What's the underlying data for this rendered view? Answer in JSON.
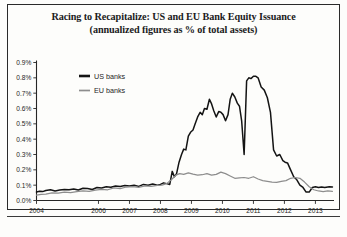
{
  "figure": {
    "title_line_1": "Racing to Recapitalize: US and EU Bank Equity Issuance",
    "title_line_2": "(annualized figures as % of total assets)"
  },
  "legend": {
    "position": "top-left-inside",
    "entries": [
      {
        "label": "US banks",
        "color": "#141414"
      },
      {
        "label": "EU banks",
        "color": "#8d8d8d"
      }
    ]
  },
  "chart_data": {
    "type": "line",
    "title": "Racing to Recapitalize: US and EU Bank Equity Issuance (annualized figures as % of total assets)",
    "xlabel": "",
    "ylabel": "",
    "grid": false,
    "legend_position": "top-left-inside",
    "xlim": [
      2004.0,
      2013.6
    ],
    "ylim": [
      0.0,
      0.9
    ],
    "ytick_labels": [
      "0.0%",
      "0.1%",
      "0.2%",
      "0.3%",
      "0.4%",
      "0.5%",
      "0.6%",
      "0.7%",
      "0.8%",
      "0.9%"
    ],
    "ytick_values": [
      0.0,
      0.1,
      0.2,
      0.3,
      0.4,
      0.5,
      0.6,
      0.7,
      0.8,
      0.9
    ],
    "xtick_labels": [
      "2004",
      "2006",
      "2007",
      "2008",
      "2009",
      "2010",
      "2011",
      "2012",
      "2013"
    ],
    "xtick_values": [
      2004,
      2006,
      2007,
      2008,
      2009,
      2010,
      2011,
      2012,
      2013
    ],
    "series": [
      {
        "name": "US banks",
        "color": "#141414",
        "x": [
          2004.0,
          2004.1,
          2004.2,
          2004.3,
          2004.45,
          2004.6,
          2004.75,
          2004.9,
          2005.05,
          2005.2,
          2005.35,
          2005.5,
          2005.65,
          2005.8,
          2005.95,
          2006.1,
          2006.25,
          2006.4,
          2006.55,
          2006.7,
          2006.85,
          2007.0,
          2007.15,
          2007.3,
          2007.45,
          2007.6,
          2007.75,
          2007.9,
          2008.0,
          2008.1,
          2008.2,
          2008.3,
          2008.38,
          2008.45,
          2008.52,
          2008.6,
          2008.68,
          2008.75,
          2008.82,
          2008.9,
          2008.97,
          2009.05,
          2009.12,
          2009.2,
          2009.28,
          2009.35,
          2009.42,
          2009.5,
          2009.58,
          2009.65,
          2009.72,
          2009.8,
          2009.88,
          2009.95,
          2010.02,
          2010.1,
          2010.18,
          2010.25,
          2010.32,
          2010.4,
          2010.48,
          2010.55,
          2010.62,
          2010.7,
          2010.78,
          2010.85,
          2010.92,
          2011.0,
          2011.08,
          2011.15,
          2011.25,
          2011.35,
          2011.45,
          2011.55,
          2011.65,
          2011.75,
          2011.85,
          2011.95,
          2012.02,
          2012.1,
          2012.2,
          2012.3,
          2012.4,
          2012.5,
          2012.6,
          2012.7,
          2012.8,
          2012.9,
          2013.0,
          2013.1,
          2013.2,
          2013.3,
          2013.45,
          2013.55
        ],
        "y": [
          0.055,
          0.06,
          0.058,
          0.065,
          0.07,
          0.062,
          0.068,
          0.072,
          0.07,
          0.075,
          0.068,
          0.08,
          0.078,
          0.072,
          0.085,
          0.082,
          0.09,
          0.086,
          0.095,
          0.092,
          0.098,
          0.095,
          0.1,
          0.092,
          0.105,
          0.1,
          0.108,
          0.1,
          0.105,
          0.115,
          0.11,
          0.105,
          0.19,
          0.155,
          0.175,
          0.25,
          0.3,
          0.335,
          0.33,
          0.42,
          0.445,
          0.46,
          0.5,
          0.545,
          0.575,
          0.56,
          0.6,
          0.595,
          0.66,
          0.63,
          0.585,
          0.545,
          0.58,
          0.575,
          0.56,
          0.52,
          0.56,
          0.66,
          0.7,
          0.675,
          0.635,
          0.615,
          0.52,
          0.3,
          0.78,
          0.8,
          0.795,
          0.81,
          0.81,
          0.8,
          0.74,
          0.72,
          0.67,
          0.575,
          0.33,
          0.29,
          0.3,
          0.26,
          0.25,
          0.245,
          0.2,
          0.155,
          0.135,
          0.1,
          0.085,
          0.055,
          0.055,
          0.085,
          0.09,
          0.085,
          0.088,
          0.085,
          0.09,
          0.088
        ]
      },
      {
        "name": "EU banks",
        "color": "#8d8d8d",
        "x": [
          2004.0,
          2004.15,
          2004.3,
          2004.5,
          2004.7,
          2004.9,
          2005.1,
          2005.3,
          2005.5,
          2005.7,
          2005.9,
          2006.1,
          2006.3,
          2006.5,
          2006.7,
          2006.9,
          2007.1,
          2007.3,
          2007.5,
          2007.7,
          2007.9,
          2008.05,
          2008.2,
          2008.35,
          2008.5,
          2008.62,
          2008.75,
          2008.9,
          2009.05,
          2009.2,
          2009.35,
          2009.5,
          2009.65,
          2009.8,
          2009.95,
          2010.1,
          2010.25,
          2010.4,
          2010.55,
          2010.7,
          2010.85,
          2011.0,
          2011.15,
          2011.3,
          2011.45,
          2011.6,
          2011.75,
          2011.9,
          2012.05,
          2012.2,
          2012.35,
          2012.5,
          2012.65,
          2012.8,
          2012.95,
          2013.1,
          2013.25,
          2013.4,
          2013.55
        ],
        "y": [
          0.035,
          0.04,
          0.042,
          0.05,
          0.048,
          0.055,
          0.052,
          0.058,
          0.062,
          0.06,
          0.068,
          0.072,
          0.07,
          0.082,
          0.078,
          0.088,
          0.09,
          0.085,
          0.095,
          0.092,
          0.098,
          0.1,
          0.11,
          0.135,
          0.165,
          0.175,
          0.17,
          0.18,
          0.172,
          0.165,
          0.168,
          0.175,
          0.165,
          0.17,
          0.185,
          0.175,
          0.16,
          0.145,
          0.148,
          0.15,
          0.145,
          0.155,
          0.14,
          0.13,
          0.125,
          0.12,
          0.118,
          0.125,
          0.13,
          0.145,
          0.15,
          0.145,
          0.12,
          0.09,
          0.07,
          0.062,
          0.058,
          0.062,
          0.06
        ]
      }
    ]
  }
}
